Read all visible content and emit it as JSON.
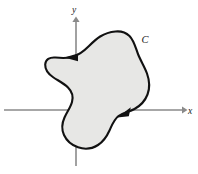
{
  "figure": {
    "background_color": "#ffffff",
    "axes": {
      "x_axis_label": "x",
      "y_axis_label": "y",
      "axis_color": "#8a8a8a",
      "origin": {
        "x": 76,
        "y": 110
      },
      "x_axis": {
        "x1": 4,
        "y1": 110,
        "x2": 186,
        "y2": 110,
        "arrow_at": "right"
      },
      "y_axis": {
        "x1": 76,
        "y1": 166,
        "x2": 76,
        "y2": 18,
        "arrow_at": "top"
      },
      "x_label_pos": {
        "x": 190,
        "y": 113
      },
      "y_label_pos": {
        "x": 73,
        "y": 12
      }
    },
    "curve": {
      "label": "C",
      "label_pos": {
        "x": 145,
        "y": 41
      },
      "orientation": "clockwise",
      "stroke_color": "#111111",
      "fill_color": "#e7e7e5",
      "stroke_width": 2.1,
      "extents": {
        "leftmost_x": 45,
        "rightmost_x": 149,
        "topmost_y": 31,
        "bottommost_y": 148
      },
      "path": "M 115.5 31.5 C 103 32.5 96 39 89 46 C 83 52 78.5 55.5 72 57 C 66 58.5 60 58 55.5 57.5 C 49.5 57 45.5 59.5 45.2 64.5 C 45 70 49 74.5 53.5 77.5 C 58.5 80.8 64 83.5 68 87.5 C 72 91.5 73.5 96.5 72 102 C 70.5 107.5 67 112 64.5 117.5 C 62 123 61.5 129.5 64 135 C 66.5 140.5 71.5 145 78 147.3 C 85 149.7 92.5 148.5 98 145 C 103.5 141.5 107 136 109.5 130.5 C 112 125 114 119.5 118.5 116 C 123 112.5 129 112 134.5 109 C 140 106 145 101 147.5 94.5 C 150 88 149.5 80.5 147 73.5 C 144.5 66.5 140.5 60.5 138 54 C 135.5 47.5 134 40.5 129.5 36 C 125.5 32.2 120.5 31 115.5 31.5 Z"
    },
    "direction_arrows": [
      {
        "name": "top-left-arrowhead",
        "points_toward": "left",
        "position": {
          "x": 70,
          "y": 57
        },
        "polygon": "77,54.2 64.5,57.6 77,60.8"
      },
      {
        "name": "right-lower-arrowhead",
        "points_toward": "down-left",
        "position": {
          "x": 123,
          "y": 113
        },
        "polygon": "129.5,108.2 118.5,116.4 128.5,115.0"
      }
    ]
  }
}
